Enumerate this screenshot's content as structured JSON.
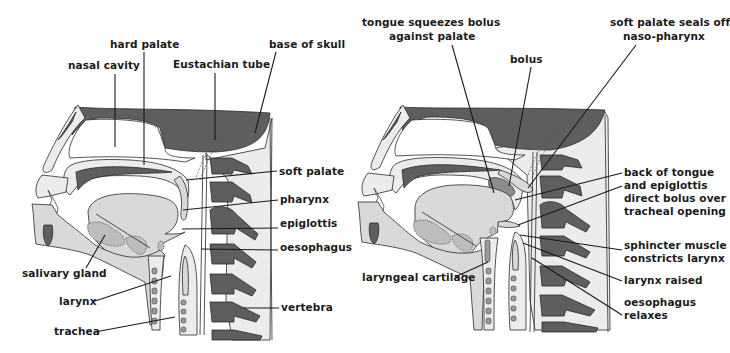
{
  "figure": {
    "colors": {
      "bone": "#5e5e5e",
      "soft_tissue": "#d9d9d9",
      "pale_tissue": "#ececec",
      "gland": "#bdbdbd",
      "text": "#1a1a1a",
      "background": "#ffffff"
    }
  },
  "left_panel": {
    "labels": {
      "hard_palate": "hard palate",
      "nasal_cavity": "nasal cavity",
      "eustachian_tube": "Eustachian tube",
      "base_of_skull": "base of skull",
      "soft_palate": "soft palate",
      "pharynx": "pharynx",
      "epiglottis": "epiglottis",
      "oesophagus": "oesophagus",
      "salivary_gland": "salivary gland",
      "larynx": "larynx",
      "vertebra": "vertebra",
      "trachea": "trachea"
    }
  },
  "right_panel": {
    "labels": {
      "tongue_squeezes_line1": "tongue squeezes bolus",
      "tongue_squeezes_line2": "against palate",
      "bolus": "bolus",
      "soft_palate_seals_line1": "soft palate seals off",
      "soft_palate_seals_line2": "naso-pharynx",
      "back_of_tongue_line1": "back of tongue",
      "back_of_tongue_line2": "and epiglottis",
      "back_of_tongue_line3": "direct bolus over",
      "back_of_tongue_line4": "tracheal opening",
      "sphincter_line1": "sphincter muscle",
      "sphincter_line2": "constricts larynx",
      "larynx_raised": "larynx raised",
      "laryngeal_cartilage": "laryngeal cartilage",
      "oesophagus_relaxes_line1": "oesophagus",
      "oesophagus_relaxes_line2": "relaxes"
    }
  }
}
